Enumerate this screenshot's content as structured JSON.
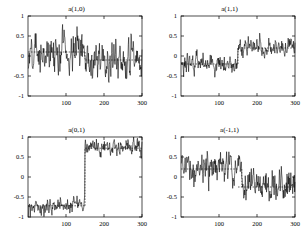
{
  "figure": {
    "background": "#ffffff",
    "line_color": "#000000",
    "axis_color": "#000000",
    "dash_color": "#000000",
    "rows": 2,
    "cols": 2
  },
  "chart_data": [
    {
      "type": "line",
      "title": "a(1,0)",
      "xlabel": "",
      "ylabel": "",
      "xlim": [
        0,
        300
      ],
      "ylim": [
        -1,
        1
      ],
      "xticks": [
        100,
        200,
        300
      ],
      "xtick_labels": [
        "100",
        "200",
        "300"
      ],
      "yticks": [
        -1,
        -0.5,
        0,
        0.5,
        1
      ],
      "ytick_labels": [
        "-1",
        "-0.5",
        "0",
        "0.5",
        "1"
      ],
      "grid": false,
      "legend": "none",
      "reference_lines": [
        {
          "style": "dashed",
          "segment_x": [
            0,
            150
          ],
          "y": 0.1
        },
        {
          "style": "dashed",
          "segment_x": [
            150,
            300
          ],
          "y": -0.1
        }
      ],
      "series": [
        {
          "name": "a(1,0)",
          "description": "noisy zero-mean series, slight level shift near x=150",
          "noise_sd": 0.22,
          "segments": [
            {
              "x_start": 0,
              "x_end": 150,
              "level": 0.1
            },
            {
              "x_start": 150,
              "x_end": 300,
              "level": -0.1
            }
          ]
        }
      ]
    },
    {
      "type": "line",
      "title": "a(1,1)",
      "xlabel": "",
      "ylabel": "",
      "xlim": [
        0,
        300
      ],
      "ylim": [
        -1,
        1
      ],
      "xticks": [
        100,
        200,
        300
      ],
      "xtick_labels": [
        "100",
        "200",
        "300"
      ],
      "yticks": [
        -1,
        -0.5,
        0,
        0.5,
        1
      ],
      "ytick_labels": [
        "-1",
        "-0.5",
        "0",
        "0.5",
        "1"
      ],
      "grid": false,
      "legend": "none",
      "reference_lines": [
        {
          "style": "dashed",
          "segment_x": [
            0,
            150
          ],
          "y": -0.2
        },
        {
          "style": "dashed",
          "segment_x": [
            150,
            300
          ],
          "y": 0.2
        }
      ],
      "series": [
        {
          "name": "a(1,1)",
          "description": "step up from -0.2 to 0.2 at x=150",
          "noise_sd": 0.1,
          "segments": [
            {
              "x_start": 0,
              "x_end": 150,
              "level": -0.2
            },
            {
              "x_start": 150,
              "x_end": 300,
              "level": 0.2
            }
          ]
        }
      ]
    },
    {
      "type": "line",
      "title": "a(0,1)",
      "xlabel": "",
      "ylabel": "",
      "xlim": [
        0,
        300
      ],
      "ylim": [
        -1,
        1
      ],
      "xticks": [
        100,
        200,
        300
      ],
      "xtick_labels": [
        "100",
        "200",
        "300"
      ],
      "yticks": [
        -1,
        -0.5,
        0,
        0.5,
        1
      ],
      "ytick_labels": [
        "-1",
        "-0.5",
        "0",
        "0.5",
        "1"
      ],
      "grid": false,
      "legend": "none",
      "reference_lines": [
        {
          "style": "dashed",
          "segment_x": [
            0,
            150
          ],
          "y": -0.72
        },
        {
          "style": "dashed",
          "segment_x": [
            150,
            300
          ],
          "y": 0.72
        }
      ],
      "series": [
        {
          "name": "a(0,1)",
          "description": "large step from -0.72 to 0.72 at x=150",
          "noise_sd": 0.09,
          "segments": [
            {
              "x_start": 0,
              "x_end": 150,
              "level": -0.72
            },
            {
              "x_start": 150,
              "x_end": 300,
              "level": 0.72
            }
          ]
        }
      ]
    },
    {
      "type": "line",
      "title": "a(-1,1)",
      "xlabel": "",
      "ylabel": "",
      "xlim": [
        0,
        300
      ],
      "ylim": [
        -1,
        1
      ],
      "xticks": [
        100,
        200,
        300
      ],
      "xtick_labels": [
        "100",
        "200",
        "300"
      ],
      "yticks": [
        -1,
        -0.5,
        0,
        0.5,
        1
      ],
      "ytick_labels": [
        "-1",
        "-0.5",
        "0",
        "0.5",
        "1"
      ],
      "grid": false,
      "legend": "none",
      "reference_lines": [
        {
          "style": "dashed",
          "segment_x": [
            0,
            150
          ],
          "y": 0.2
        },
        {
          "style": "dashed",
          "segment_x": [
            150,
            300
          ],
          "y": -0.25
        }
      ],
      "series": [
        {
          "name": "a(-1,1)",
          "description": "step down from 0.2 to -0.25 near x=160",
          "noise_sd": 0.17,
          "segments": [
            {
              "x_start": 0,
              "x_end": 160,
              "level": 0.2
            },
            {
              "x_start": 160,
              "x_end": 300,
              "level": -0.25
            }
          ]
        }
      ]
    }
  ]
}
